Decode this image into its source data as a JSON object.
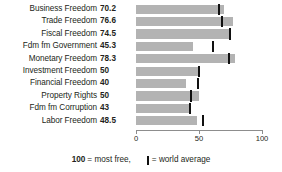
{
  "chart_data": {
    "type": "bar",
    "title": "",
    "subtitle": "",
    "xlabel": "",
    "ylabel": "",
    "orientation": "horizontal",
    "xlim": [
      0,
      100
    ],
    "xticks": [
      0,
      50,
      100
    ],
    "xtick_labels": [
      "0",
      "50",
      "100"
    ],
    "grid": false,
    "legend_position": "bottom",
    "categories": [
      "Business Freedom",
      "Trade Freedom",
      "Fiscal Freedom",
      "Fdm fm Government",
      "Monetary Freedom",
      "Investment Freedom",
      "Financial Freedom",
      "Property Rights",
      "Fdm fm Corruption",
      "Labor Freedom"
    ],
    "values": [
      70.2,
      76.6,
      74.5,
      45.3,
      78.3,
      50,
      40,
      50,
      43,
      48.5
    ],
    "value_labels": [
      "70.2",
      "76.6",
      "74.5",
      "45.3",
      "78.3",
      "50",
      "40",
      "50",
      "43",
      "48.5"
    ],
    "series": [
      {
        "name": "score",
        "values": [
          70.2,
          76.6,
          74.5,
          45.3,
          78.3,
          50,
          40,
          50,
          43,
          48.5
        ]
      },
      {
        "name": "world average",
        "values": [
          65.5,
          68.0,
          74.5,
          61.5,
          74.0,
          50.0,
          49.0,
          43.5,
          42.5,
          53.0
        ]
      }
    ],
    "bar_color": "#b3b3b3",
    "marker_color": "#111111",
    "axis_color": "#8d8d8d"
  },
  "legend": {
    "most_free_value": "100",
    "most_free_text": "= most free,",
    "world_average_text": "= world average"
  }
}
